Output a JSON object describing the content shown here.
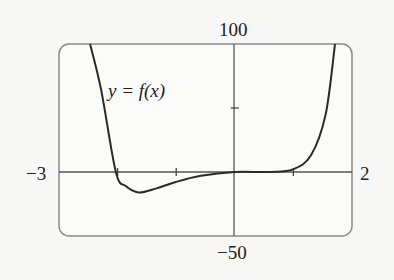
{
  "chart_data": {
    "type": "line",
    "title": "",
    "xlabel": "",
    "ylabel": "",
    "xlim": [
      -3,
      2
    ],
    "ylim": [
      -50,
      100
    ],
    "grid": false,
    "x_ticks": [
      -2,
      -1,
      1
    ],
    "y_ticks": [
      50
    ],
    "axis_labels": {
      "x_min": "−3",
      "x_max": "2",
      "y_max": "100",
      "y_min": "−50"
    },
    "annotation": "y = f(x)",
    "series": [
      {
        "name": "y = f(x)",
        "x": [
          -2.47,
          -2.28,
          -2.03,
          -1.86,
          -1.64,
          -1.35,
          -1.02,
          -0.58,
          0.0,
          0.61,
          0.99,
          1.3,
          1.55,
          1.71
        ],
        "y": [
          100,
          64,
          0,
          -11,
          -16,
          -13,
          -8,
          -3,
          0,
          0,
          2,
          13,
          45,
          100
        ]
      }
    ],
    "colors": {
      "curve": "#2a2a2a",
      "axes": "#555555",
      "frame": "#888888"
    }
  }
}
